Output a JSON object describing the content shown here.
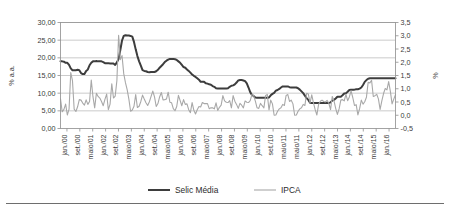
{
  "chart_data": {
    "type": "line",
    "title": "",
    "subtitle": "",
    "xlabel": "",
    "ylabel": "% a.a.",
    "ylabel_secondary": "%",
    "grid": true,
    "legend_position": "bottom",
    "axes": {
      "left": {
        "label": "% a.a.",
        "min": 0,
        "max": 30,
        "step": 5,
        "ticks": [
          "0,00",
          "5,00",
          "10,00",
          "15,00",
          "20,00",
          "25,00",
          "30,00"
        ],
        "tick_values": [
          0,
          5,
          10,
          15,
          20,
          25,
          30
        ]
      },
      "right": {
        "label": "%",
        "min": -0.5,
        "max": 3.5,
        "step": 0.5,
        "ticks": [
          "-0,5",
          "0,0",
          "0,5",
          "1,0",
          "1,5",
          "2,0",
          "2,5",
          "3,0",
          "3,5"
        ],
        "tick_values": [
          -0.5,
          0,
          0.5,
          1,
          1.5,
          2,
          2.5,
          3,
          3.5
        ]
      },
      "x": {
        "tick_labels": [
          "jan./00",
          "set./00",
          "maio/01",
          "jan./02",
          "set./02",
          "maio/03",
          "jan./04",
          "set./04",
          "maio/05",
          "jan./06",
          "set./06",
          "maio/07",
          "jan./08",
          "set./08",
          "maio/09",
          "jan./10",
          "set./10",
          "maio/11",
          "maio/11",
          "jan./12",
          "set./12",
          "maio/13",
          "jan./14",
          "set./14",
          "maio/15",
          "jan./16"
        ]
      }
    },
    "legend": [
      {
        "name": "Selic Média",
        "color": "#3d3d3d",
        "width": 2.0
      },
      {
        "name": "IPCA",
        "color": "#a8a8a8",
        "width": 1.1
      }
    ],
    "series": [
      {
        "name": "Selic Média",
        "axis": "left",
        "color": "#3d3d3d",
        "values": [
          19.0,
          19.0,
          18.9,
          18.6,
          18.6,
          18.0,
          17.0,
          16.5,
          16.5,
          16.5,
          16.6,
          16.5,
          15.7,
          15.4,
          15.4,
          16.3,
          16.7,
          17.9,
          18.6,
          19.0,
          19.0,
          19.1,
          19.0,
          19.0,
          19.0,
          18.8,
          18.5,
          18.5,
          18.5,
          18.4,
          18.4,
          18.4,
          18.0,
          18.7,
          19.7,
          22.2,
          24.9,
          26.2,
          26.4,
          26.3,
          26.3,
          26.2,
          26.0,
          24.5,
          22.4,
          20.5,
          19.0,
          17.8,
          16.5,
          16.3,
          16.2,
          16.0,
          15.9,
          16.0,
          16.0,
          16.0,
          16.2,
          16.6,
          17.2,
          17.7,
          18.2,
          18.8,
          19.2,
          19.5,
          19.7,
          19.7,
          19.7,
          19.6,
          19.4,
          19.0,
          18.6,
          18.0,
          17.4,
          17.2,
          16.7,
          16.3,
          15.8,
          15.3,
          14.9,
          14.6,
          14.2,
          13.8,
          13.2,
          13.2,
          13.2,
          12.8,
          12.7,
          12.5,
          12.4,
          12.0,
          11.8,
          11.4,
          11.3,
          11.3,
          11.3,
          11.3,
          11.3,
          11.3,
          11.4,
          11.8,
          12.1,
          12.2,
          12.5,
          13.0,
          13.6,
          13.7,
          13.7,
          13.6,
          13.4,
          12.8,
          11.6,
          10.3,
          9.5,
          9.2,
          8.8,
          8.7,
          8.7,
          8.7,
          8.7,
          8.7,
          8.7,
          8.7,
          8.8,
          9.4,
          9.8,
          10.1,
          10.7,
          10.9,
          11.2,
          11.6,
          11.9,
          11.9,
          11.9,
          11.9,
          11.7,
          11.6,
          11.6,
          11.6,
          11.6,
          11.4,
          11.0,
          10.5,
          10.0,
          9.3,
          8.6,
          8.1,
          7.3,
          7.2,
          7.2,
          7.2,
          7.2,
          7.2,
          7.2,
          7.2,
          7.2,
          7.2,
          7.2,
          7.2,
          7.4,
          7.9,
          8.1,
          8.5,
          9.0,
          9.0,
          9.0,
          9.4,
          9.9,
          10.0,
          10.4,
          10.9,
          11.0,
          11.0,
          11.0,
          11.1,
          11.1,
          11.3,
          11.6,
          12.3,
          13.2,
          13.7,
          14.1,
          14.2,
          14.2,
          14.2,
          14.2,
          14.2,
          14.2,
          14.2,
          14.2,
          14.2,
          14.2,
          14.2,
          14.2,
          14.2,
          14.2,
          14.2,
          14.2
        ]
      },
      {
        "name": "IPCA",
        "axis": "right",
        "color": "#a8a8a8",
        "values": [
          0.62,
          0.13,
          0.22,
          0.42,
          0.01,
          0.23,
          1.61,
          1.31,
          0.23,
          0.14,
          0.32,
          0.59,
          0.57,
          0.46,
          0.38,
          0.58,
          0.41,
          0.52,
          1.33,
          0.7,
          0.28,
          0.83,
          0.71,
          0.65,
          0.52,
          0.36,
          0.6,
          0.8,
          0.21,
          0.42,
          1.19,
          0.65,
          0.72,
          1.31,
          3.02,
          2.1,
          2.25,
          1.57,
          1.23,
          0.97,
          0.61,
          0.15,
          0.2,
          0.34,
          0.78,
          0.29,
          0.34,
          0.52,
          0.76,
          0.61,
          0.47,
          0.37,
          0.51,
          0.71,
          0.91,
          0.69,
          0.33,
          0.44,
          0.69,
          0.86,
          0.58,
          0.59,
          0.61,
          0.87,
          0.49,
          0.47,
          0.25,
          0.17,
          0.33,
          0.75,
          0.55,
          0.36,
          0.59,
          0.41,
          0.43,
          0.21,
          0.1,
          0.48,
          0.19,
          0.05,
          0.21,
          0.33,
          0.31,
          0.48,
          0.44,
          0.44,
          0.44,
          0.25,
          0.28,
          0.28,
          0.24,
          0.47,
          0.18,
          0.3,
          0.38,
          0.74,
          0.54,
          0.49,
          0.48,
          0.55,
          0.28,
          0.74,
          0.53,
          0.41,
          0.26,
          0.45,
          0.38,
          0.28,
          0.54,
          0.49,
          0.48,
          0.55,
          0.79,
          0.74,
          0.53,
          0.28,
          0.26,
          0.45,
          0.36,
          0.28,
          0.75,
          0.78,
          0.2,
          0.57,
          0.43,
          0.0,
          0.01,
          0.15,
          0.24,
          0.28,
          0.41,
          0.37,
          0.75,
          0.78,
          0.52,
          0.57,
          0.43,
          0.0,
          0.01,
          0.15,
          0.24,
          0.28,
          0.41,
          0.37,
          0.83,
          0.8,
          0.47,
          0.77,
          0.47,
          0.21,
          0.01,
          0.41,
          0.53,
          0.57,
          0.52,
          0.5,
          0.56,
          0.45,
          0.21,
          0.71,
          0.55,
          0.26,
          0.03,
          0.24,
          0.57,
          0.59,
          0.54,
          0.79,
          0.55,
          0.69,
          0.92,
          0.67,
          0.37,
          0.4,
          0.01,
          0.25,
          0.57,
          0.42,
          0.51,
          0.68,
          1.24,
          1.22,
          1.32,
          0.71,
          0.74,
          0.79,
          0.62,
          0.22,
          0.54,
          0.82,
          1.01,
          0.96,
          1.27,
          0.9,
          0.43,
          0.61,
          0.78
        ]
      }
    ]
  },
  "footer": {
    "rule_color": "#6e6e6e"
  }
}
